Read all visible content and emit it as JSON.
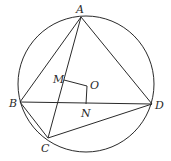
{
  "diagram": {
    "type": "geometry",
    "circle": {
      "cx": 86,
      "cy": 84,
      "r": 68
    },
    "points": {
      "A": {
        "x": 81,
        "y": 17,
        "label": "A"
      },
      "B": {
        "x": 20,
        "y": 102,
        "label": "B"
      },
      "C": {
        "x": 48,
        "y": 138,
        "label": "C"
      },
      "D": {
        "x": 152,
        "y": 104,
        "label": "D"
      },
      "M": {
        "x": 64,
        "y": 80,
        "label": "M"
      },
      "O": {
        "x": 87,
        "y": 86,
        "label": "O"
      },
      "N": {
        "x": 86,
        "y": 104,
        "label": "N"
      }
    },
    "segments": [
      "AB",
      "AC",
      "AD",
      "BD",
      "BC",
      "CD",
      "MO",
      "ON"
    ]
  }
}
